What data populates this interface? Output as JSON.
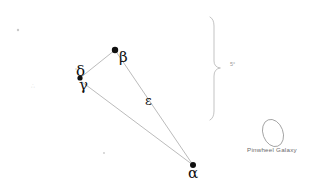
{
  "diagram": {
    "background_color": "#ffffff",
    "ink_color": "#111111",
    "line_color": "#aaaaaa",
    "faint_color": "#d2d2d2",
    "width": 313,
    "height": 194,
    "stars": [
      {
        "id": "beta",
        "label": "β",
        "x": 115,
        "y": 50,
        "r": 3.2,
        "label_x": 119,
        "label_y": 56
      },
      {
        "id": "delta",
        "label": "δ",
        "x": 80,
        "y": 78,
        "r": 2.6,
        "label_x": 80,
        "label_y": 71
      },
      {
        "id": "gamma",
        "label": "γ",
        "x": 84,
        "y": 84,
        "r": 0.0,
        "label_x": 82,
        "label_y": 85
      },
      {
        "id": "alpha",
        "label": "α",
        "x": 193,
        "y": 165,
        "r": 3.0,
        "label_x": 190,
        "label_y": 172
      }
    ],
    "lines": [
      {
        "from": "delta",
        "to": "beta"
      },
      {
        "from": "beta",
        "to": "alpha"
      },
      {
        "from": "delta",
        "to": "alpha"
      }
    ],
    "segment_labels": [
      {
        "id": "epsilon",
        "label": "ε",
        "x": 148,
        "y": 100
      }
    ],
    "faint_stars": [
      {
        "x": 18,
        "y": 30,
        "r": 1.2
      },
      {
        "x": 104,
        "y": 153,
        "r": 0.9
      },
      {
        "x": 76,
        "y": 69,
        "r": 0.8
      }
    ],
    "brace": {
      "x": 214,
      "top": 17,
      "bottom": 120,
      "mid": 68,
      "depth": 7,
      "note": "5°",
      "note_x": 231,
      "note_y": 65
    },
    "deep_sky": {
      "name": "Pinwheel Galaxy",
      "ellipse_cx": 273,
      "ellipse_cy": 133,
      "ellipse_rx": 10,
      "ellipse_ry": 14,
      "ellipse_rotation": -20,
      "label_x": 247,
      "label_y": 152
    },
    "faint_marks": [
      {
        "text": "∴",
        "x": 33,
        "y": 88
      }
    ]
  }
}
